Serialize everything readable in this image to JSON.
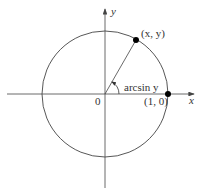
{
  "diagram": {
    "labels": {
      "y_axis": "y",
      "x_axis": "x",
      "point_xy": "(x, y)",
      "point_10": "(1, 0)",
      "origin": "0",
      "angle": "arcsin y"
    },
    "colors": {
      "stroke": "#444444",
      "text": "#333333",
      "point": "#000000"
    }
  }
}
